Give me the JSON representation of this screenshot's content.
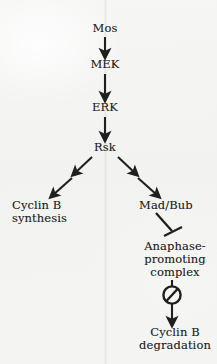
{
  "figure": {
    "kind": "signaling-pathway-diagram",
    "background_color": "#f4f4f3",
    "ink_color": "#1f1f1e"
  },
  "nodes": {
    "mos": "Mos",
    "mek": "MEK",
    "erk": "ERK",
    "rsk": "Rsk",
    "cyclinb_synthesis": "Cyclin B\nsynthesis",
    "madbub": "Mad/Bub",
    "apc": "Anaphase-\npromoting\ncomplex",
    "cyclinb_degradation": "Cyclin B\ndegradation"
  },
  "icons": {
    "arrow_down": "down-arrow-icon",
    "arrow_broken_left": "broken-diagonal-arrow-left-icon",
    "arrow_broken_right": "broken-diagonal-arrow-right-icon",
    "tbar": "inhibition-tbar-icon",
    "block": "circle-slash-block-icon"
  },
  "edges": [
    {
      "from": "Mos",
      "to": "MEK",
      "type": "activation"
    },
    {
      "from": "MEK",
      "to": "ERK",
      "type": "activation"
    },
    {
      "from": "ERK",
      "to": "Rsk",
      "type": "activation"
    },
    {
      "from": "Rsk",
      "to": "Cyclin B synthesis",
      "type": "indirect-activation"
    },
    {
      "from": "Rsk",
      "to": "Mad/Bub",
      "type": "indirect-activation"
    },
    {
      "from": "Mad/Bub",
      "to": "Anaphase-promoting complex",
      "type": "inhibition"
    },
    {
      "from": "Anaphase-promoting complex",
      "to": "Cyclin B degradation",
      "type": "blocked-activation"
    }
  ]
}
